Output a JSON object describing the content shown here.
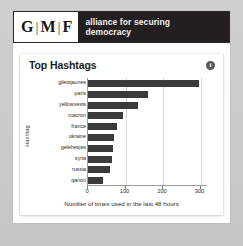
{
  "brand": {
    "letters": [
      "G",
      "M",
      "F"
    ],
    "separator": "|",
    "tagline_line1": "alliance for securing",
    "tagline_line2": "democracy",
    "tagline_bg": "#231f20"
  },
  "card": {
    "title": "Top Hashtags",
    "info_icon_label": "i"
  },
  "chart_data": {
    "type": "bar",
    "orientation": "horizontal",
    "title": "Top Hashtags",
    "xlabel": "Number of times used in the last 48 hours",
    "ylabel": "Hashtag",
    "categories": [
      "giletsjaunes",
      "paris",
      "yellowvests",
      "macron",
      "france",
      "ukraine",
      "gelehesjes",
      "syria",
      "russia",
      "qanon"
    ],
    "values": [
      295,
      160,
      133,
      93,
      78,
      68,
      66,
      65,
      58,
      40
    ],
    "xlim": [
      0,
      320
    ],
    "xticks": [
      0,
      100,
      200,
      300
    ],
    "xtick_labels": [
      "0",
      "100",
      "200",
      "300"
    ],
    "bar_color": "#3a3a3a",
    "grid": "vertical",
    "legend": "none"
  }
}
